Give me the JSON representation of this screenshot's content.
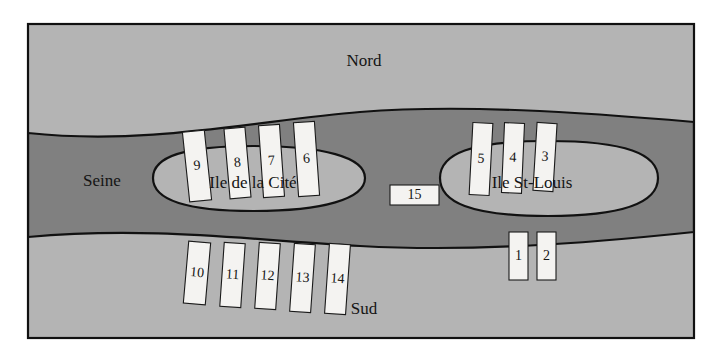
{
  "figure": {
    "title_alt": "Schematic map of the Seine with Ile de la Cite and Ile St-Louis",
    "background_color": "#ffffff",
    "frame_color": "#111111",
    "land_color": "#b4b4b4",
    "river_color": "#808080",
    "island_color": "#b4b4b4",
    "bridge_fill": "#f4f3f1",
    "bridge_stroke": "#1a1a1a",
    "text_color": "#141414"
  },
  "labels": {
    "north": "Nord",
    "south": "Sud",
    "river": "Seine",
    "island_left": "Ile de la Cité",
    "island_right": "Ile St-Louis"
  },
  "bridges": [
    {
      "id": "bridge-1",
      "label": "1",
      "x": 509,
      "y": 232,
      "w": 19,
      "h": 48,
      "angle": 0,
      "side": "south",
      "island": "ile-st-louis"
    },
    {
      "id": "bridge-2",
      "label": "2",
      "x": 537,
      "y": 232,
      "w": 19,
      "h": 48,
      "angle": 0,
      "side": "south",
      "island": "ile-st-louis"
    },
    {
      "id": "bridge-3",
      "label": "3",
      "x": 535,
      "y": 123,
      "w": 20,
      "h": 68,
      "angle": 3.5,
      "side": "north",
      "island": "ile-st-louis"
    },
    {
      "id": "bridge-4",
      "label": "4",
      "x": 503,
      "y": 123,
      "w": 20,
      "h": 70,
      "angle": 2.5,
      "side": "north",
      "island": "ile-st-louis"
    },
    {
      "id": "bridge-5",
      "label": "5",
      "x": 471,
      "y": 123,
      "w": 20,
      "h": 72,
      "angle": 3,
      "side": "north",
      "island": "ile-st-louis"
    },
    {
      "id": "bridge-6",
      "label": "6",
      "x": 296,
      "y": 122,
      "w": 21,
      "h": 74,
      "angle": -4,
      "side": "north",
      "island": "ile-de-la-cite"
    },
    {
      "id": "bridge-7",
      "label": "7",
      "x": 261,
      "y": 125,
      "w": 21,
      "h": 72,
      "angle": -4,
      "side": "north",
      "island": "ile-de-la-cite"
    },
    {
      "id": "bridge-8",
      "label": "8",
      "x": 227,
      "y": 128,
      "w": 21,
      "h": 70,
      "angle": -5,
      "side": "north",
      "island": "ile-de-la-cite"
    },
    {
      "id": "bridge-9",
      "label": "9",
      "x": 186,
      "y": 131,
      "w": 22,
      "h": 70,
      "angle": -6,
      "side": "north",
      "island": "ile-de-la-cite"
    },
    {
      "id": "bridge-10",
      "label": "10",
      "x": 186,
      "y": 242,
      "w": 22,
      "h": 62,
      "angle": 5,
      "side": "south",
      "island": "ile-de-la-cite"
    },
    {
      "id": "bridge-11",
      "label": "11",
      "x": 222,
      "y": 243,
      "w": 21,
      "h": 64,
      "angle": 4,
      "side": "south",
      "island": "ile-de-la-cite"
    },
    {
      "id": "bridge-12",
      "label": "12",
      "x": 257,
      "y": 243,
      "w": 21,
      "h": 66,
      "angle": 4,
      "side": "south",
      "island": "ile-de-la-cite"
    },
    {
      "id": "bridge-13",
      "label": "13",
      "x": 292,
      "y": 244,
      "w": 21,
      "h": 68,
      "angle": 4,
      "side": "south",
      "island": "ile-de-la-cite"
    },
    {
      "id": "bridge-14",
      "label": "14",
      "x": 327,
      "y": 244,
      "w": 21,
      "h": 70,
      "angle": 4,
      "side": "south",
      "island": "ile-de-la-cite"
    },
    {
      "id": "bridge-15",
      "label": "15",
      "x": 390,
      "y": 185,
      "w": 49,
      "h": 20,
      "angle": 0,
      "side": "center",
      "island": "between-islands"
    }
  ],
  "geometry": {
    "frame": {
      "x": 28,
      "y": 24,
      "w": 666,
      "h": 314
    },
    "river_left_top_y": 133,
    "river_left_bottom_y": 237,
    "river_right_top_y": 122,
    "river_right_bottom_y": 232,
    "island_left": {
      "cx": 253,
      "cy": 178,
      "rx": 112,
      "ry": 33
    },
    "island_right": {
      "cx": 548,
      "cy": 178,
      "rx": 110,
      "ry": 38
    }
  },
  "label_positions": {
    "north": {
      "x": 364,
      "y": 62
    },
    "south": {
      "x": 364,
      "y": 310
    },
    "river": {
      "x": 102,
      "y": 182
    },
    "island_left": {
      "x": 253,
      "y": 184
    },
    "island_right": {
      "x": 532,
      "y": 184
    }
  }
}
